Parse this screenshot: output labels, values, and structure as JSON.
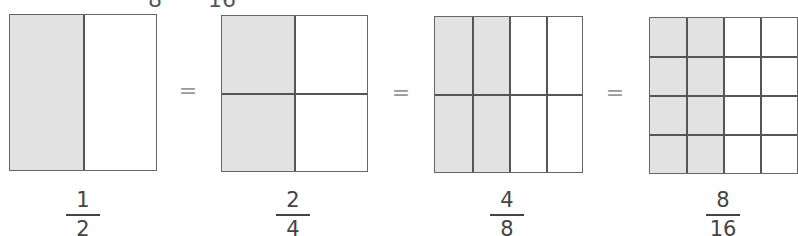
{
  "partial_top_text": {
    "left": "8",
    "right": "16"
  },
  "equals_symbol": "=",
  "colors": {
    "shaded": "#e2e2e2",
    "line": "#555555",
    "unshaded": "#ffffff"
  },
  "models": [
    {
      "label": {
        "numerator": "1",
        "denominator": "2"
      },
      "columns": 2,
      "rows": 1,
      "shaded_columns": 1
    },
    {
      "label": {
        "numerator": "2",
        "denominator": "4"
      },
      "columns": 2,
      "rows": 2,
      "shaded_columns": 1
    },
    {
      "label": {
        "numerator": "4",
        "denominator": "8"
      },
      "columns": 4,
      "rows": 2,
      "shaded_columns": 2
    },
    {
      "label": {
        "numerator": "8",
        "denominator": "16"
      },
      "columns": 4,
      "rows": 4,
      "shaded_columns": 2
    }
  ]
}
